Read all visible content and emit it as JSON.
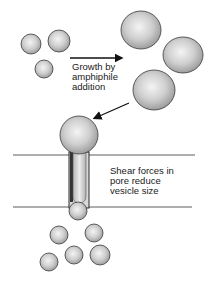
{
  "diagram": {
    "labels": {
      "growth": [
        "Growth by",
        "amphiphile",
        "addition"
      ],
      "shear": [
        "Shear forces in",
        "pore reduce",
        "vesicle size"
      ]
    },
    "stages": [
      {
        "name": "small-vesicles",
        "count": 3
      },
      {
        "name": "grown-vesicles",
        "count": 3
      },
      {
        "name": "vesicle-extruding-through-pore",
        "count": 1
      },
      {
        "name": "daughter-vesicles",
        "count": 5
      }
    ],
    "colors": {
      "sphere_light": "#f2f2f2",
      "sphere_dark": "#a8a8a8",
      "outline": "#3a3a3a",
      "line": "#333333",
      "arrow": "#111111"
    }
  }
}
